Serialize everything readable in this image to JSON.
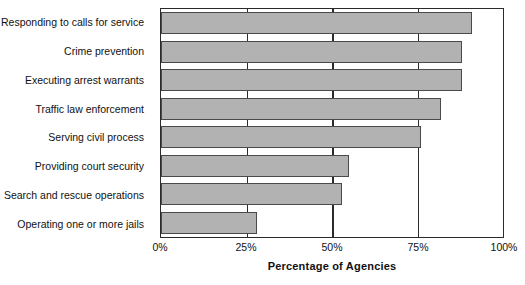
{
  "chart_data": {
    "type": "bar",
    "orientation": "horizontal",
    "title": "",
    "xlabel": "Percentage of Agencies",
    "ylabel": "",
    "xlim": [
      0,
      100
    ],
    "xticks": [
      "0%",
      "25%",
      "50%",
      "75%",
      "100%"
    ],
    "xtick_values": [
      0,
      25,
      50,
      75,
      100
    ],
    "grid": true,
    "legend": false,
    "bar_color": "#b2b2b2",
    "bar_border_color": "#4a4a4a",
    "axis_color": "#2b2b2b",
    "categories": [
      "Responding to calls for service",
      "Crime prevention",
      "Executing arrest warrants",
      "Traffic law enforcement",
      "Serving civil process",
      "Providing court security",
      "Search and rescue operations",
      "Operating one or more jails"
    ],
    "values": [
      91,
      88,
      88,
      82,
      76,
      55,
      53,
      28
    ]
  }
}
